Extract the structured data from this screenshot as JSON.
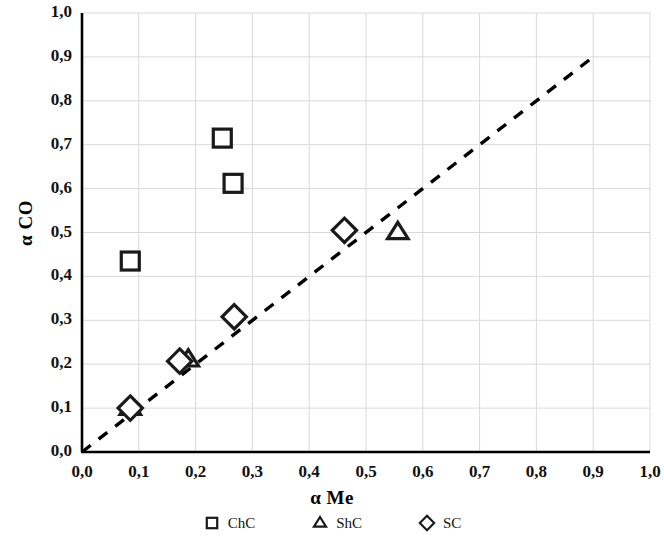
{
  "chart_data": {
    "type": "scatter",
    "title": "",
    "xlabel": "α Me",
    "ylabel": "α CO",
    "xlim": [
      0.0,
      1.0
    ],
    "ylim": [
      0.0,
      1.0
    ],
    "grid": true,
    "legend_position": "bottom",
    "xticks": [
      "0,0",
      "0,1",
      "0,2",
      "0,3",
      "0,4",
      "0,5",
      "0,6",
      "0,7",
      "0,8",
      "0,9",
      "1,0"
    ],
    "yticks": [
      "0,0",
      "0,1",
      "0,2",
      "0,3",
      "0,4",
      "0,5",
      "0,6",
      "0,7",
      "0,8",
      "0,9",
      "1,0"
    ],
    "xtick_values": [
      0.0,
      0.1,
      0.2,
      0.3,
      0.4,
      0.5,
      0.6,
      0.7,
      0.8,
      0.9,
      1.0
    ],
    "ytick_values": [
      0.0,
      0.1,
      0.2,
      0.3,
      0.4,
      0.5,
      0.6,
      0.7,
      0.8,
      0.9,
      1.0
    ],
    "marker_color": "#1a1a1a",
    "gridline_color": "#d9d9d9",
    "axis_color": "#000000",
    "series": [
      {
        "name": "ChC",
        "marker": "square",
        "points": [
          {
            "x": 0.085,
            "y": 0.435
          },
          {
            "x": 0.247,
            "y": 0.715
          },
          {
            "x": 0.266,
            "y": 0.612
          }
        ]
      },
      {
        "name": "ShC",
        "marker": "triangle",
        "points": [
          {
            "x": 0.085,
            "y": 0.1
          },
          {
            "x": 0.187,
            "y": 0.21
          },
          {
            "x": 0.556,
            "y": 0.5
          }
        ]
      },
      {
        "name": "SC",
        "marker": "diamond",
        "points": [
          {
            "x": 0.085,
            "y": 0.1
          },
          {
            "x": 0.172,
            "y": 0.207
          },
          {
            "x": 0.268,
            "y": 0.308
          },
          {
            "x": 0.462,
            "y": 0.505
          }
        ]
      }
    ],
    "reference_line": {
      "name": "parity-line",
      "style": "dashed",
      "from": {
        "x": 0.0,
        "y": 0.0
      },
      "to": {
        "x": 0.9,
        "y": 0.9
      }
    }
  },
  "legend": {
    "items": [
      {
        "label": "ChC",
        "marker": "square"
      },
      {
        "label": "ShC",
        "marker": "triangle"
      },
      {
        "label": "SC",
        "marker": "diamond"
      }
    ]
  }
}
